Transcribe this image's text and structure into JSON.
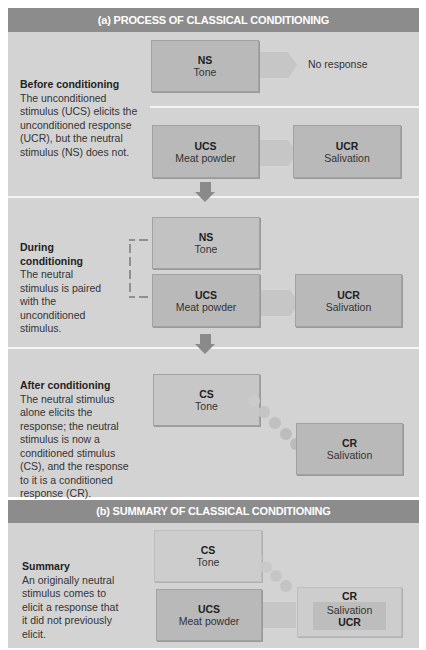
{
  "section_a": {
    "header": "(a) PROCESS OF CLASSICAL CONDITIONING",
    "before": {
      "title": "Before conditioning",
      "text": "The unconditioned stimulus (UCS)  elicits the unconditioned response (UCR), but the neutral stimulus (NS) does not.",
      "ns_box": {
        "abbr": "NS",
        "label": "Tone"
      },
      "no_response": "No response",
      "ucs_box": {
        "abbr": "UCS",
        "label": "Meat powder"
      },
      "ucr_box": {
        "abbr": "UCR",
        "label": "Salivation"
      }
    },
    "during": {
      "title": "During conditioning",
      "text": "The neutral stimulus is paired with the unconditioned stimulus.",
      "ns_box": {
        "abbr": "NS",
        "label": "Tone"
      },
      "ucs_box": {
        "abbr": "UCS",
        "label": "Meat powder"
      },
      "ucr_box": {
        "abbr": "UCR",
        "label": "Salivation"
      }
    },
    "after": {
      "title": "After conditioning",
      "text": "The neutral stimulus alone elicits the response; the neutral stimulus is now a conditioned stimulus (CS), and the response to it is a conditioned response (CR).",
      "cs_box": {
        "abbr": "CS",
        "label": "Tone"
      },
      "cr_box": {
        "abbr": "CR",
        "label": "Salivation"
      }
    }
  },
  "section_b": {
    "header": "(b) SUMMARY OF CLASSICAL CONDITIONING",
    "summary": {
      "title": "Summary",
      "text": "An originally neutral stimulus comes to elicit a response that it did not previously elicit.",
      "cs_box": {
        "abbr": "CS",
        "label": "Tone"
      },
      "ucs_box": {
        "abbr": "UCS",
        "label": "Meat powder"
      },
      "cr_box": {
        "abbr": "CR",
        "inner_label": "Salivation",
        "inner_abbr": "UCR"
      }
    }
  },
  "colors": {
    "header_bg": "#8c8c8c",
    "panel_bg": "#d3d3d3",
    "box_bg": "#b9b9b9",
    "arrow": "#8a8a8a",
    "divider": "#f4f4f4"
  }
}
